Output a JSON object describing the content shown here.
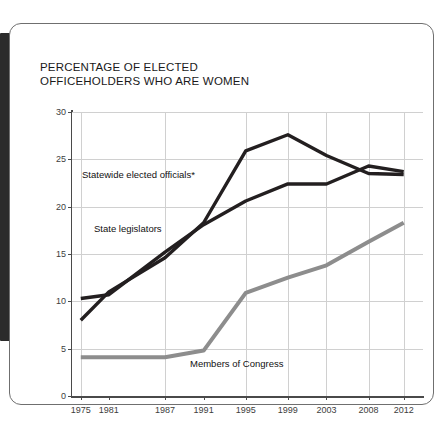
{
  "card": {
    "title": "PERCENTAGE OF ELECTED\nOFFICEHOLDERS WHO ARE WOMEN"
  },
  "labels": {
    "statewide": "Statewide elected officials*",
    "legislators": "State legislators",
    "congress": "Members of Congress"
  },
  "colors": {
    "dark_series": "#231f20",
    "gray_series": "#8d8d8d",
    "grid": "#d0d0d0",
    "axis": "#4a4a4a",
    "spine": "#2b2b2b",
    "card_border": "#6f6f6f"
  },
  "chart_data": {
    "type": "line",
    "title": "PERCENTAGE OF ELECTED OFFICEHOLDERS WHO ARE WOMEN",
    "xlabel": "",
    "ylabel": "",
    "ylim": [
      0,
      30
    ],
    "yticks": [
      0,
      5,
      10,
      15,
      20,
      25,
      30
    ],
    "xticks": [
      "1975",
      "1981",
      "1987",
      "1991",
      "1995",
      "1999",
      "2003",
      "2008",
      "2012"
    ],
    "x": [
      1975,
      1981,
      1987,
      1991,
      1995,
      1999,
      2003,
      2008,
      2012
    ],
    "grid": true,
    "legend": "inline-labels",
    "series": [
      {
        "name": "Statewide elected officials*",
        "color": "#231f20",
        "values": [
          8.0,
          11.0,
          14.6,
          18.3,
          25.9,
          27.6,
          25.4,
          23.5,
          23.4
        ]
      },
      {
        "name": "State legislators",
        "color": "#231f20",
        "values": [
          10.3,
          10.7,
          15.2,
          18.1,
          20.6,
          22.4,
          22.4,
          24.3,
          23.7
        ]
      },
      {
        "name": "Members of Congress",
        "color": "#8d8d8d",
        "values": [
          4.1,
          4.1,
          4.1,
          4.8,
          10.9,
          12.5,
          13.8,
          16.3,
          18.3
        ]
      }
    ]
  }
}
